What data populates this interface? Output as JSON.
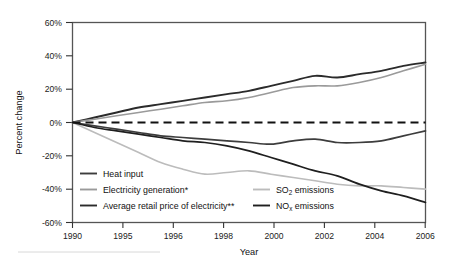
{
  "chart_data": {
    "type": "line",
    "title": "",
    "xlabel": "Year",
    "ylabel": "Percent change",
    "xlim": [
      1990,
      2006
    ],
    "ylim": [
      -60,
      60
    ],
    "grid": false,
    "legend_position": "inside-bottom-left",
    "y_ticks": [
      "60%",
      "40%",
      "20%",
      "0%",
      "-20%",
      "-40%",
      "-60%"
    ],
    "y_tick_values": [
      60,
      40,
      20,
      0,
      -20,
      -40,
      -60
    ],
    "x_ticks": [
      "1990",
      "1995",
      "1996",
      "1998",
      "2000",
      "2002",
      "2004",
      "2006"
    ],
    "x_tick_values": [
      1990,
      1992,
      1994,
      1996,
      1998,
      2000,
      2002,
      2004,
      2006
    ],
    "zero_reference_line": {
      "value": 0,
      "style": "dashed"
    },
    "x": [
      1990,
      1991,
      1992,
      1993,
      1994,
      1995,
      1996,
      1997,
      1998,
      1999,
      2000,
      2001,
      2002,
      2003,
      2004,
      2005,
      2006
    ],
    "series": [
      {
        "name": "Average retail price of electricity**",
        "color": "#2b2b2b",
        "width": 1.9,
        "values": [
          0,
          3,
          6,
          9,
          11,
          13,
          15,
          17,
          19,
          22,
          25,
          28,
          27,
          29,
          31,
          34,
          36
        ]
      },
      {
        "name": "Electricity generation*",
        "color": "#9a9a9a",
        "width": 1.6,
        "values": [
          0,
          2,
          4,
          6,
          8,
          10,
          12,
          13,
          15,
          18,
          21,
          22,
          22,
          24,
          27,
          31,
          35
        ]
      },
      {
        "name": "Heat input",
        "color": "#3d3d3d",
        "width": 1.7,
        "values": [
          0,
          -2,
          -4,
          -6,
          -8,
          -9,
          -10,
          -11,
          -12,
          -13,
          -11,
          -10,
          -12,
          -12,
          -11,
          -8,
          -5
        ]
      },
      {
        "name": "SO2 emissions",
        "color": "#bcbcbc",
        "width": 1.6,
        "values": [
          0,
          -6,
          -12,
          -18,
          -24,
          -28,
          -31,
          -30,
          -29,
          -31,
          -33,
          -35,
          -37,
          -38,
          -38,
          -39,
          -40
        ]
      },
      {
        "name": "NOx emissions",
        "color": "#1f1f1f",
        "width": 1.7,
        "values": [
          0,
          -3,
          -5,
          -7,
          -9,
          -11,
          -12,
          -14,
          -17,
          -21,
          -25,
          -29,
          -32,
          -37,
          -41,
          -44,
          -48
        ]
      }
    ]
  },
  "axes": {
    "y_label": "Percent change",
    "x_label": "Year",
    "y_tick_labels": [
      "60%",
      "40%",
      "20%",
      "0%",
      "-20%",
      "-40%",
      "-60%"
    ],
    "x_tick_labels": [
      "1990",
      "1995",
      "1996",
      "1998",
      "2000",
      "2002",
      "2004",
      "2006"
    ]
  },
  "legend": {
    "column_left": [
      {
        "label": "Heat input",
        "color": "#3d3d3d"
      },
      {
        "label": "Electricity generation*",
        "color": "#9a9a9a"
      },
      {
        "label": "Average retail price of electricity**",
        "color": "#2b2b2b"
      }
    ],
    "column_right": [
      {
        "label_main": "SO",
        "label_sub": "2",
        "label_tail": " emissions",
        "color": "#bcbcbc"
      },
      {
        "label_main": "NO",
        "label_sub": "x",
        "label_tail": " emissions",
        "color": "#1f1f1f"
      }
    ]
  }
}
